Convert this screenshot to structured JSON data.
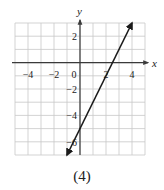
{
  "caption": "(4)",
  "chart_data": {
    "type": "line",
    "title": "",
    "xlabel": "x",
    "ylabel": "y",
    "xlim": [
      -5,
      5
    ],
    "ylim": [
      -7,
      3
    ],
    "grid": true,
    "grid_step": 1,
    "x_tick_labels": [
      {
        "value": -4,
        "label": "−4"
      },
      {
        "value": -2,
        "label": "−2"
      },
      {
        "value": 0,
        "label": "0"
      },
      {
        "value": 2,
        "label": "2"
      },
      {
        "value": 4,
        "label": "4"
      }
    ],
    "y_tick_labels": [
      {
        "value": 2,
        "label": "2"
      },
      {
        "value": -2,
        "label": "−2"
      },
      {
        "value": -4,
        "label": "−4"
      },
      {
        "value": -6,
        "label": "−6"
      }
    ],
    "series": [
      {
        "name": "y = 2x − 5",
        "equation": "y = 2x - 5",
        "slope": 2,
        "intercept": -5,
        "x": [
          -1,
          0,
          2.5,
          4
        ],
        "y": [
          -7,
          -5,
          0,
          3
        ],
        "arrows": "both"
      }
    ],
    "colors": {
      "grid": "#c8c8c8",
      "axis": "#3a3a3a",
      "line": "#1a1a1a"
    }
  }
}
